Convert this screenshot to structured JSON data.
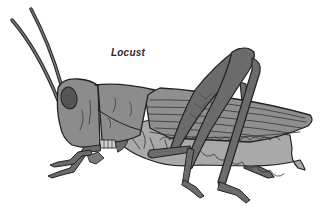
{
  "illustration": {
    "subject": "locust",
    "label": "Locust",
    "style": "grayscale line illustration",
    "colors": {
      "background": "#ffffff",
      "outline": "#222222",
      "body": "#8c8c8c",
      "body_light": "#a9a9a9",
      "hind_leg": "#6b6b6b",
      "eye": "#555555",
      "wing": "#8f8f8f"
    },
    "parts": [
      "antennae",
      "head",
      "eye",
      "pronotum",
      "wings",
      "abdomen",
      "hind-legs",
      "middle-leg",
      "front-legs",
      "mouthparts"
    ]
  }
}
